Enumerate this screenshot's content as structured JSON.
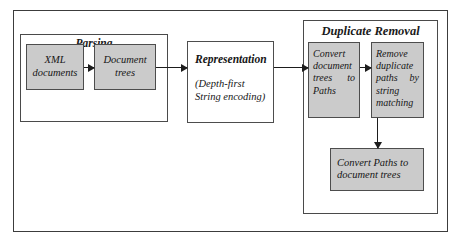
{
  "diagram": {
    "colors": {
      "shaded_fill": "#cbcbcb",
      "plain_fill": "#ffffff",
      "border": "#4d4d4d",
      "outer_border": "#3c3c3c",
      "arrow": "#1d1d1d"
    },
    "groups": [
      {
        "id": "parsing",
        "label": "Parsing"
      },
      {
        "id": "duplicate_removal",
        "label": "Duplicate Removal"
      }
    ],
    "nodes": {
      "xml_documents": {
        "line1": "XML",
        "line2": "documents",
        "fill": "shaded"
      },
      "document_trees": {
        "line1": "Document",
        "line2": "trees",
        "fill": "shaded"
      },
      "representation": {
        "heading": "Representation",
        "sub_line1": "(Depth-first",
        "sub_line2": "String encoding)",
        "fill": "plain"
      },
      "convert_document_trees_to_paths": {
        "line1": "Convert",
        "line2": "document",
        "line3": "trees      to",
        "line4": "Paths",
        "fill": "shaded"
      },
      "remove_duplicate_paths": {
        "line1": "Remove",
        "line2": "duplicate",
        "line3": "paths    by",
        "line4": "string",
        "line5": "matching",
        "fill": "shaded"
      },
      "convert_paths_to_document_trees": {
        "line1": "Convert Paths to",
        "line2": "document trees",
        "fill": "shaded"
      }
    },
    "arrows": [
      {
        "id": "xml-to-trees",
        "from": "xml_documents",
        "to": "document_trees",
        "direction": "right"
      },
      {
        "id": "trees-to-representation",
        "from": "document_trees",
        "to": "representation",
        "direction": "right"
      },
      {
        "id": "representation-to-convert",
        "from": "representation",
        "to": "convert_document_trees_to_paths",
        "direction": "right"
      },
      {
        "id": "convert-to-remove",
        "from": "convert_document_trees_to_paths",
        "to": "remove_duplicate_paths",
        "direction": "right"
      },
      {
        "id": "remove-to-convert-paths",
        "from": "remove_duplicate_paths",
        "to": "convert_paths_to_document_trees",
        "direction": "down"
      }
    ]
  }
}
